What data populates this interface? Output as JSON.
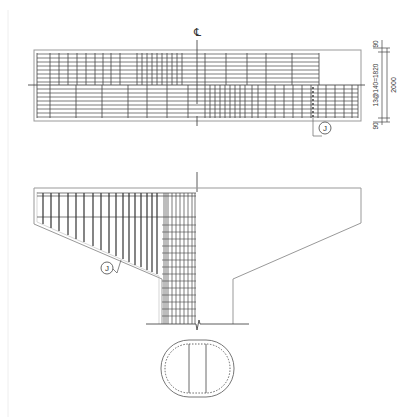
{
  "drawing": {
    "centerline_label": "CL",
    "callout_top": "J",
    "callout_bottom": "J",
    "dim_top": "90",
    "dim_mid": "13@140=1820",
    "dim_total": "2000",
    "dim_bottom": "90"
  },
  "colors": {
    "line": "#333333",
    "outline": "#999999",
    "background": "#ffffff"
  }
}
